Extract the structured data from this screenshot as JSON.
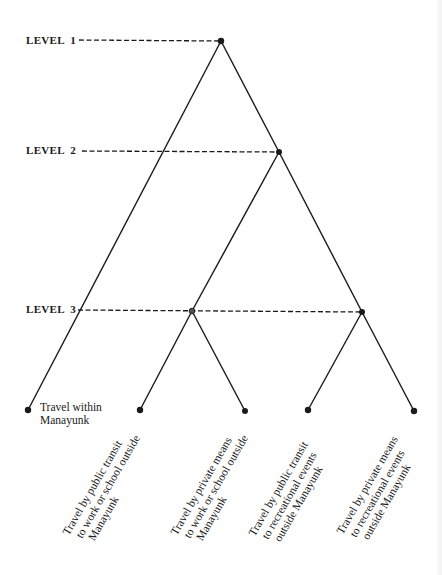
{
  "levels": [
    {
      "label": "LEVEL  1",
      "y": 41
    },
    {
      "label": "LEVEL  2",
      "y": 152
    },
    {
      "label": "LEVEL  3",
      "y": 311
    }
  ],
  "nodes": {
    "root": {
      "x": 221,
      "y": 41
    },
    "level2": {
      "x": 279,
      "y": 152
    },
    "level3_left": {
      "x": 192,
      "y": 311
    },
    "level3_right": {
      "x": 362,
      "y": 312
    }
  },
  "leaves": [
    {
      "id": "within",
      "x": 28,
      "y": 410,
      "lines": [
        "Travel within",
        "Manayunk"
      ]
    },
    {
      "id": "public-work",
      "x": 140,
      "y": 410,
      "lines": [
        "Travel by public transit",
        "to work or school outside",
        "Manayunk"
      ]
    },
    {
      "id": "private-work",
      "x": 245,
      "y": 411,
      "lines": [
        "Travel by private means",
        "to work or school outside",
        "Manayunk"
      ]
    },
    {
      "id": "public-rec",
      "x": 308,
      "y": 410,
      "lines": [
        "Travel by public transit",
        "to recreational events",
        "outside Manayunk"
      ]
    },
    {
      "id": "private-rec",
      "x": 414,
      "y": 411,
      "lines": [
        "Travel by private means",
        "to recreational events",
        "outside Manayunk"
      ]
    }
  ],
  "colors": {
    "ink": "#1a1a1a",
    "paper": "#ffffff"
  }
}
